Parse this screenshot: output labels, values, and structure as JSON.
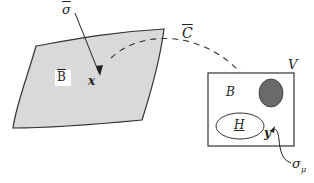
{
  "diagram": {
    "type": "mapping-illustration",
    "colors": {
      "surface_fill": "#d9d9d9",
      "outline": "#333333",
      "dark_ellipse": "#6a6a6a",
      "box_fill": "#ffffff"
    },
    "left_region": {
      "label": "B",
      "label_decoration": "overline",
      "point_label": "x",
      "arrow_label": "σ",
      "arrow_label_decoration": "overline"
    },
    "connector": {
      "label": "C",
      "label_decoration": "overline",
      "style": "dashed"
    },
    "right_region": {
      "outer_label": "V",
      "inner_label": "B",
      "ellipse_label": "H",
      "point_label": "y",
      "arrow_label": "σ",
      "arrow_label_subscript": "μ"
    }
  }
}
